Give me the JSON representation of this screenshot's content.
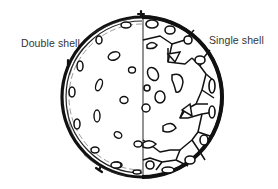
{
  "diagram": {
    "labels": {
      "left": "Double shell",
      "right": "Single shell"
    },
    "colors": {
      "ink": "#111111",
      "label": "#333333",
      "background": "#ffffff"
    },
    "halves": [
      {
        "side": "left",
        "name": "Double shell",
        "features": [
          "thick double outer wall",
          "sparse small pores",
          "protruding spikes"
        ]
      },
      {
        "side": "right",
        "name": "Single shell",
        "features": [
          "single outer wall",
          "polygonal cell network",
          "larger pores"
        ]
      }
    ]
  }
}
